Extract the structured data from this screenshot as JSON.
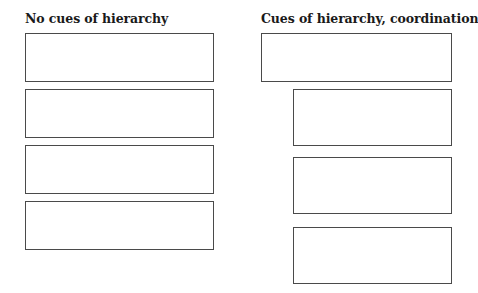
{
  "diagram": {
    "left_panel": {
      "title": "No cues of hierarchy",
      "boxes": [
        {
          "x": 25,
          "y": 33,
          "w": 189,
          "h": 49
        },
        {
          "x": 25,
          "y": 89,
          "w": 189,
          "h": 49
        },
        {
          "x": 25,
          "y": 145,
          "w": 189,
          "h": 49
        },
        {
          "x": 25,
          "y": 201,
          "w": 189,
          "h": 49
        }
      ]
    },
    "right_panel": {
      "title": "Cues of hierarchy, coordination",
      "boxes": [
        {
          "x": 261,
          "y": 33,
          "w": 191,
          "h": 49
        },
        {
          "x": 293,
          "y": 89,
          "w": 159,
          "h": 57
        },
        {
          "x": 293,
          "y": 157,
          "w": 159,
          "h": 57
        },
        {
          "x": 293,
          "y": 227,
          "w": 159,
          "h": 57
        }
      ]
    },
    "colors": {
      "border": "#4a4a4a",
      "text": "#1a1a1a",
      "background": "#ffffff"
    }
  }
}
